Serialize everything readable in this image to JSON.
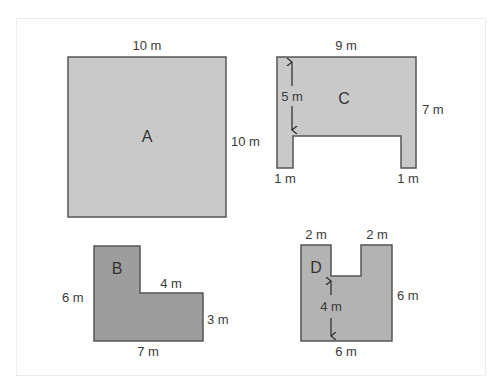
{
  "colors": {
    "light_fill": "#c9c9c9",
    "dark_fill": "#9d9d9d",
    "stroke": "#555555",
    "text": "#333333"
  },
  "shapes": {
    "A": {
      "label": "A",
      "top": "10 m",
      "right": "10 m"
    },
    "B": {
      "label": "B",
      "left": "6 m",
      "step": "4 m",
      "right": "3 m",
      "bottom": "7 m"
    },
    "C": {
      "label": "C",
      "top": "9 m",
      "right": "7 m",
      "inner_height": "5 m",
      "left_leg": "1 m",
      "right_leg": "1 m"
    },
    "D": {
      "label": "D",
      "top_left": "2 m",
      "top_right": "2 m",
      "right": "6 m",
      "inner_height": "4 m",
      "bottom": "6 m"
    }
  }
}
